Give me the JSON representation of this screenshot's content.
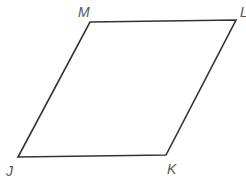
{
  "figure": {
    "shape": "parallelogram",
    "stroke_color": "#333333",
    "vertices": [
      {
        "name": "M",
        "x": 90,
        "y": 22
      },
      {
        "name": "L",
        "x": 236,
        "y": 20
      },
      {
        "name": "K",
        "x": 166,
        "y": 155
      },
      {
        "name": "J",
        "x": 18,
        "y": 157
      }
    ],
    "labels": {
      "M": "M",
      "L": "L",
      "K": "K",
      "J": "J"
    }
  }
}
